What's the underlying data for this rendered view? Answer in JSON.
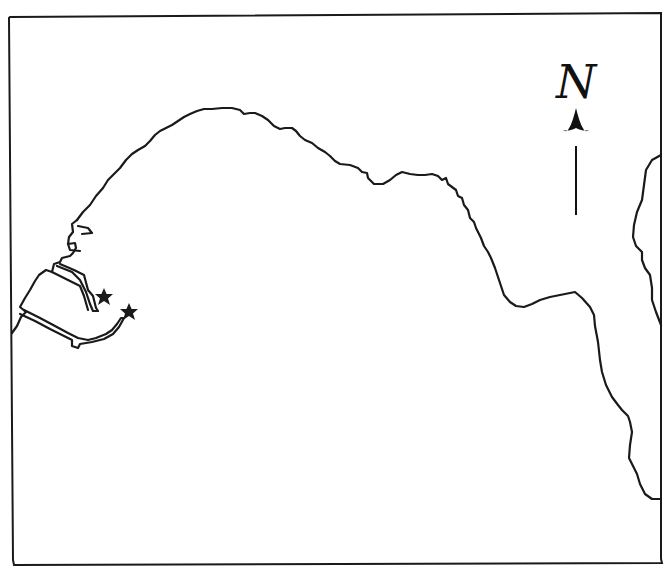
{
  "map": {
    "type": "coastline sketch map",
    "frame": {
      "x": 9,
      "y": 15,
      "width": 652,
      "height": 550
    },
    "colors": {
      "ink": "#1a1a1a",
      "background": "#ffffff"
    },
    "north_arrow": {
      "label": "N",
      "position": {
        "x": 576,
        "y": 60
      }
    },
    "markers": [
      {
        "type": "star",
        "x": 104,
        "y": 297,
        "name": "star-marker-1"
      },
      {
        "type": "star",
        "x": 129,
        "y": 312,
        "name": "star-marker-2"
      }
    ],
    "features": [
      {
        "name": "main-coastline",
        "description": "bay coastline from west harbor to east"
      },
      {
        "name": "harbor-breakwaters",
        "description": "two jetties at west side"
      },
      {
        "name": "east-island",
        "description": "landmass at right edge"
      }
    ]
  }
}
